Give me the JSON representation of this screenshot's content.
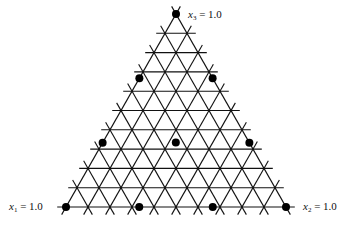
{
  "diagram": {
    "type": "simplex-lattice",
    "components": 3,
    "grid_divisions": 10,
    "lattice_degree": 3,
    "vertices": {
      "top": {
        "x": 176,
        "y": 14
      },
      "left": {
        "x": 66,
        "y": 207
      },
      "right": {
        "x": 286,
        "y": 207
      }
    },
    "labels": [
      {
        "var": "x",
        "sub": "3",
        "text": " = 1.0",
        "x": 188,
        "y": 8
      },
      {
        "var": "x",
        "sub": "1",
        "text": " = 1.0",
        "x": 9,
        "y": 200
      },
      {
        "var": "x",
        "sub": "2",
        "text": " = 1.0",
        "x": 303,
        "y": 200
      }
    ],
    "design_points": [
      {
        "x1": 1,
        "x2": 0,
        "x3": 0
      },
      {
        "x1": 0,
        "x2": 1,
        "x3": 0
      },
      {
        "x1": 0,
        "x2": 0,
        "x3": 1
      },
      {
        "x1": 0.667,
        "x2": 0.333,
        "x3": 0
      },
      {
        "x1": 0.333,
        "x2": 0.667,
        "x3": 0
      },
      {
        "x1": 0.667,
        "x2": 0,
        "x3": 0.333
      },
      {
        "x1": 0.333,
        "x2": 0,
        "x3": 0.667
      },
      {
        "x1": 0,
        "x2": 0.667,
        "x3": 0.333
      },
      {
        "x1": 0,
        "x2": 0.333,
        "x3": 0.667
      },
      {
        "x1": 0.333,
        "x2": 0.333,
        "x3": 0.333
      }
    ],
    "line_color": "#111111",
    "point_color": "#000000"
  }
}
